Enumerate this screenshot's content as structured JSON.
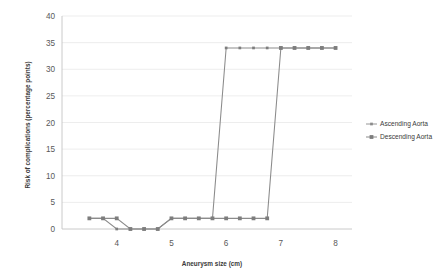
{
  "chart_data": {
    "type": "line",
    "title": "",
    "xlabel": "Aneurysm size (cm)",
    "ylabel": "Risk of complications (percentage points)",
    "xlim": [
      3.0,
      8.3
    ],
    "ylim": [
      0,
      40
    ],
    "xticks": [
      4,
      5,
      6,
      7,
      8
    ],
    "xtick_labels": [
      "4",
      "5",
      "6",
      "7",
      "8"
    ],
    "yticks": [
      0,
      5,
      10,
      15,
      20,
      25,
      30,
      35,
      40
    ],
    "ytick_labels": [
      "0",
      "5",
      "10",
      "15",
      "20",
      "25",
      "30",
      "35",
      "40"
    ],
    "grid": true,
    "grid_axis": "y",
    "legend_position": "right",
    "series": [
      {
        "name": "Ascending Aorta",
        "marker": "square-small",
        "color": "#8b8b8b",
        "x": [
          3.5,
          3.75,
          4.0,
          4.25,
          4.5,
          4.75,
          5.0,
          5.25,
          5.5,
          5.75,
          6.0,
          6.25,
          6.5,
          6.75,
          7.0,
          7.25,
          7.5,
          7.75,
          8.0
        ],
        "y": [
          2,
          2,
          0,
          0,
          0,
          0,
          2,
          2,
          2,
          2,
          34,
          34,
          34,
          34,
          34,
          34,
          34,
          34,
          34
        ]
      },
      {
        "name": "Descending Aorta",
        "marker": "square-large",
        "color": "#7d7d7d",
        "x": [
          3.5,
          3.75,
          4.0,
          4.25,
          4.5,
          4.75,
          5.0,
          5.25,
          5.5,
          5.75,
          6.0,
          6.25,
          6.5,
          6.75,
          7.0,
          7.25,
          7.5,
          7.75,
          8.0
        ],
        "y": [
          2,
          2,
          2,
          0,
          0,
          0,
          2,
          2,
          2,
          2,
          2,
          2,
          2,
          2,
          34,
          34,
          34,
          34,
          34
        ]
      }
    ]
  },
  "legend": {
    "items": [
      {
        "label": "Ascending Aorta"
      },
      {
        "label": "Descending Aorta"
      }
    ]
  },
  "axes": {
    "x_title": "Aneurysm size (cm)",
    "y_title": "Risk of complications (percentage points)"
  }
}
